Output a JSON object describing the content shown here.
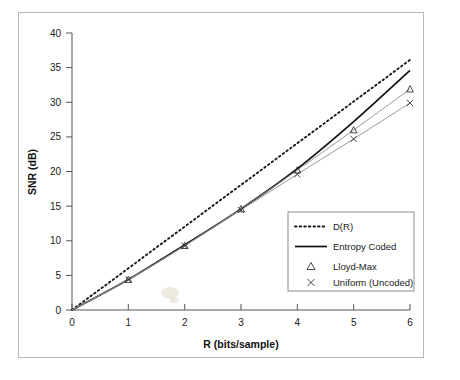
{
  "chart_data": {
    "type": "line",
    "title": "",
    "xlabel": "R (bits/sample)",
    "ylabel": "SNR (dB)",
    "xlim": [
      0,
      6
    ],
    "ylim": [
      0,
      40
    ],
    "grid": false,
    "legend_position": "inside-lower-right",
    "x_ticks": [
      "0",
      "1",
      "2",
      "3",
      "4",
      "5",
      "6"
    ],
    "y_ticks": [
      "0",
      "5",
      "10",
      "15",
      "20",
      "25",
      "30",
      "35",
      "40"
    ],
    "x_tick_values": [
      0,
      1,
      2,
      3,
      4,
      5,
      6
    ],
    "y_tick_values": [
      0,
      5,
      10,
      15,
      20,
      25,
      30,
      35,
      40
    ],
    "x": [
      0,
      1,
      2,
      3,
      4,
      5,
      6
    ],
    "series": [
      {
        "name": "D(R)",
        "style": "dotted",
        "marker": "none",
        "color": "#1a1a1a",
        "values": [
          0,
          6.02,
          12.04,
          18.06,
          24.08,
          30.1,
          36.12
        ]
      },
      {
        "name": "Entropy Coded",
        "style": "solid",
        "marker": "none",
        "color": "#111111",
        "values": [
          0,
          4.4,
          9.4,
          14.6,
          20.4,
          27.2,
          34.6
        ]
      },
      {
        "name": "Lloyd-Max",
        "style": "thin-solid",
        "marker": "triangle",
        "color": "#8c8c8c",
        "values": [
          0,
          4.4,
          9.3,
          14.6,
          20.2,
          26.0,
          31.9
        ]
      },
      {
        "name": "Uniform (Uncoded)",
        "style": "thin-solid",
        "marker": "x",
        "color": "#8c8c8c",
        "values": [
          0,
          4.4,
          9.25,
          14.45,
          19.6,
          24.7,
          29.9
        ]
      }
    ],
    "legend_entries": [
      {
        "label": "D(R)",
        "swatch": "dotted-line"
      },
      {
        "label": "Entropy Coded",
        "swatch": "solid-line"
      },
      {
        "label": "Lloyd-Max",
        "swatch": "triangle-marker"
      },
      {
        "label": "Uniform (Uncoded)",
        "swatch": "x-marker"
      }
    ]
  },
  "axes": {
    "x_title": "R (bits/sample)",
    "y_title": "SNR (dB)"
  }
}
